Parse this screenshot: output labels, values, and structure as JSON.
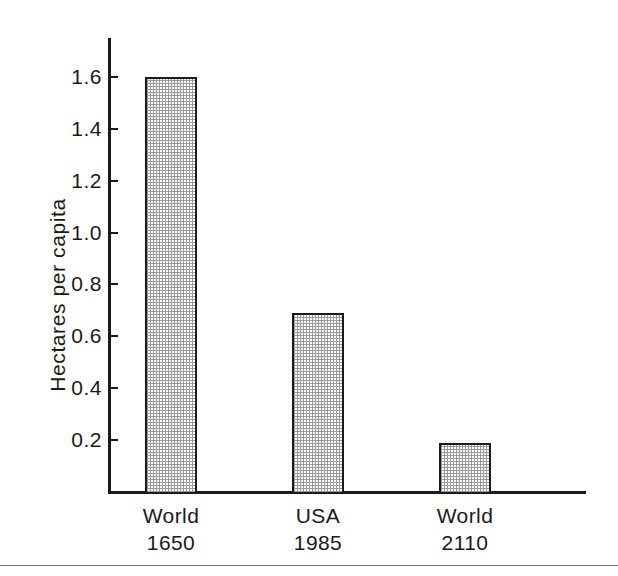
{
  "chart_data": {
    "type": "bar",
    "title": "",
    "subtitle": "",
    "xlabel": "",
    "ylabel": "Hectares per capita",
    "categories": [
      "World\n1650",
      "USA\n1985",
      "World\n2110"
    ],
    "category_lines": [
      [
        "World",
        "1650"
      ],
      [
        "USA",
        "1985"
      ],
      [
        "World",
        "2110"
      ]
    ],
    "values": [
      1.6,
      0.69,
      0.19
    ],
    "ylim": [
      0.0,
      1.75
    ],
    "yticks": [
      0.2,
      0.4,
      0.6,
      0.8,
      1.0,
      1.2,
      1.4,
      1.6
    ],
    "ytick_labels": [
      "0.2",
      "0.4",
      "0.6",
      "0.8",
      "1.0",
      "1.2",
      "1.4",
      "1.6"
    ],
    "grid": false,
    "legend": false,
    "legend_position": "none",
    "bar_fill": "stipple-halftone",
    "bar_fill_color": "#d9d9d9",
    "bar_edge_color": "#1b1b1b",
    "axis_color": "#1b1b1b",
    "background_color": "#ffffff",
    "tick_direction": "in",
    "annotations": []
  },
  "figure": {
    "background_color": "#ffffff",
    "rule_color": "#6f6f6f"
  }
}
